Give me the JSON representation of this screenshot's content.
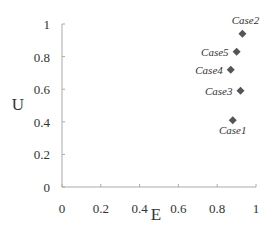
{
  "chart_data": {
    "type": "scatter",
    "title": "",
    "xlabel": "E",
    "ylabel": "U",
    "xlim": [
      0,
      1
    ],
    "ylim": [
      0,
      1
    ],
    "xticks": [
      "0",
      "0.2",
      "0.4",
      "0.6",
      "0.8",
      "1"
    ],
    "yticks": [
      "0",
      "0.2",
      "0.4",
      "0.6",
      "0.8",
      "1"
    ],
    "grid": false,
    "legend": null,
    "marker": "diamond",
    "marker_color": "#555555",
    "points": [
      {
        "label": "Case1",
        "x": 0.88,
        "y": 0.41
      },
      {
        "label": "Case2",
        "x": 0.93,
        "y": 0.94
      },
      {
        "label": "Case3",
        "x": 0.92,
        "y": 0.59
      },
      {
        "label": "Case4",
        "x": 0.87,
        "y": 0.72
      },
      {
        "label": "Case5",
        "x": 0.9,
        "y": 0.83
      }
    ]
  }
}
